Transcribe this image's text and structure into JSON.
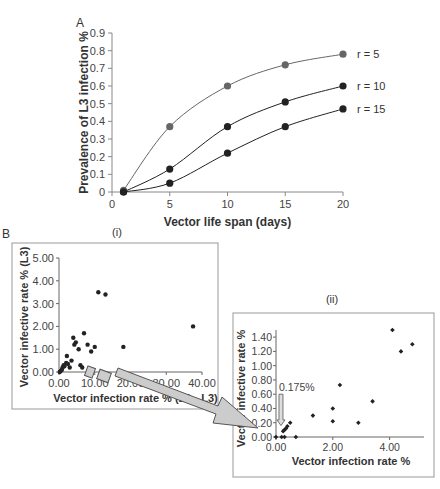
{
  "chart_data": [
    {
      "panel_label": "A",
      "type": "line",
      "title": "",
      "xlabel": "Vector life span (days)",
      "ylabel": "Prevalence of L3 infection %",
      "xlim": [
        0,
        20
      ],
      "ylim": [
        0,
        0.9
      ],
      "xticks": [
        "0",
        "5",
        "10",
        "15",
        "20"
      ],
      "yticks": [
        "0",
        "0.1",
        "0.2",
        "0.3",
        "0.4",
        "0.5",
        "0.6",
        "0.7",
        "0.8",
        "0.9"
      ],
      "grid": false,
      "legend": "inline-right",
      "x": [
        1,
        5,
        10,
        15,
        20
      ],
      "series": [
        {
          "name": "r = 5",
          "values": [
            0.01,
            0.37,
            0.6,
            0.72,
            0.78
          ],
          "color": "#666666"
        },
        {
          "name": "r = 10",
          "values": [
            0.0,
            0.13,
            0.37,
            0.51,
            0.6
          ],
          "color": "#222222"
        },
        {
          "name": "r = 15",
          "values": [
            0.0,
            0.05,
            0.22,
            0.37,
            0.47
          ],
          "color": "#222222"
        }
      ]
    },
    {
      "panel_label": "B",
      "subpanel": "(i)",
      "type": "scatter",
      "xlabel": "Vector infection rate % (L1 - L3)",
      "ylabel": "Vector infective rate % (L3)",
      "xlim": [
        0,
        40
      ],
      "ylim": [
        0,
        5
      ],
      "xticks": [
        "0.00",
        "10.00",
        "20.00",
        "30.00",
        "40.00"
      ],
      "yticks": [
        "0.00",
        "1.00",
        "2.00",
        "3.00",
        "4.00",
        "5.00"
      ],
      "grid": false,
      "points": [
        [
          0.2,
          0.0
        ],
        [
          0.5,
          0.05
        ],
        [
          0.8,
          0.1
        ],
        [
          1.0,
          0.2
        ],
        [
          1.3,
          0.3
        ],
        [
          1.5,
          0.25
        ],
        [
          2.0,
          0.4
        ],
        [
          2.5,
          0.35
        ],
        [
          2.2,
          0.7
        ],
        [
          3.0,
          0.2
        ],
        [
          3.5,
          0.5
        ],
        [
          4.0,
          1.5
        ],
        [
          4.3,
          1.2
        ],
        [
          4.7,
          1.3
        ],
        [
          5.5,
          1.0
        ],
        [
          6.0,
          0.3
        ],
        [
          6.5,
          0.2
        ],
        [
          7.0,
          1.7
        ],
        [
          8.0,
          1.2
        ],
        [
          9.0,
          0.9
        ],
        [
          10.0,
          1.1
        ],
        [
          11.0,
          3.5
        ],
        [
          13.0,
          3.4
        ],
        [
          18.0,
          1.1
        ],
        [
          37.5,
          2.0
        ]
      ]
    },
    {
      "panel_label": "B",
      "subpanel": "(ii)",
      "type": "scatter",
      "xlabel": "Vector infection rate %",
      "ylabel": "Vector infective rate %",
      "xlim": [
        0,
        5
      ],
      "ylim": [
        0,
        1.5
      ],
      "xticks": [
        "0.00",
        "2.00",
        "4.00"
      ],
      "yticks": [
        "0.00",
        "0.20",
        "0.40",
        "0.60",
        "0.80",
        "1.00",
        "1.20",
        "1.40"
      ],
      "grid": false,
      "annotation": "0.175%",
      "annotation_x": 0.175,
      "points": [
        [
          0.0,
          0.0
        ],
        [
          0.2,
          0.0
        ],
        [
          0.3,
          0.0
        ],
        [
          0.25,
          0.08
        ],
        [
          0.3,
          0.1
        ],
        [
          0.35,
          0.12
        ],
        [
          0.4,
          0.15
        ],
        [
          0.5,
          0.2
        ],
        [
          0.7,
          0.0
        ],
        [
          1.3,
          0.3
        ],
        [
          2.0,
          0.4
        ],
        [
          2.0,
          0.22
        ],
        [
          2.25,
          0.73
        ],
        [
          2.9,
          0.2
        ],
        [
          3.4,
          0.5
        ],
        [
          4.1,
          1.5
        ],
        [
          4.4,
          1.2
        ],
        [
          4.8,
          1.3
        ]
      ]
    }
  ]
}
